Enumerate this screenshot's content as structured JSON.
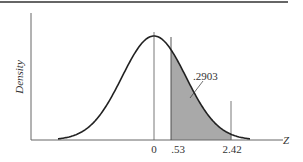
{
  "chart_data": {
    "type": "area",
    "title": "",
    "xlabel": "Z",
    "ylabel": "Density",
    "distribution": "standard normal",
    "x_ticks": [
      "0",
      ".53",
      "2.42"
    ],
    "x_tick_values": [
      0,
      0.53,
      2.42
    ],
    "shaded_region": {
      "from": 0.53,
      "to": 2.42,
      "area": 0.2903
    },
    "annotation": ".2903",
    "grid": false,
    "legend": null
  },
  "labels": {
    "ylabel": "Density",
    "xlabel": "Z",
    "tick0": "0",
    "tick1": ".53",
    "tick2": "2.42",
    "area": ".2903"
  },
  "colors": {
    "curve": "#222222",
    "shade": "#a9a9a9",
    "axis": "#555555",
    "rule": "#333333"
  }
}
